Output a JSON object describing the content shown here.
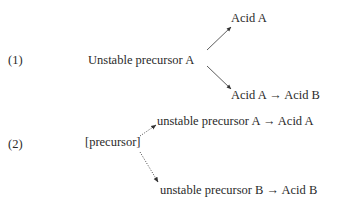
{
  "diagram": {
    "scheme1": {
      "label": "(1)",
      "source": "Unstable precursor A",
      "branch_upper": "Acid A",
      "branch_lower": "Acid A → Acid B",
      "arrow_style": "solid"
    },
    "scheme2": {
      "label": "(2)",
      "source": "[precursor]",
      "branch_upper": "unstable precursor A → Acid A",
      "branch_lower": "unstable precursor B → Acid B",
      "arrow_style": "dotted"
    },
    "colors": {
      "text": "#2a2a2a",
      "arrow": "#333333",
      "background": "#ffffff"
    }
  }
}
